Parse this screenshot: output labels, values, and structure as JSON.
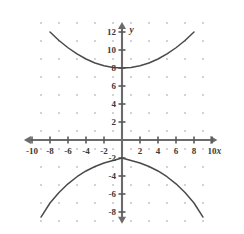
{
  "chart_data": {
    "type": "line",
    "title": "",
    "xlabel": "x",
    "ylabel": "y",
    "xlim": [
      -10.8,
      10.8
    ],
    "ylim": [
      -9.2,
      13.2
    ],
    "grid": "dots",
    "grid_spacing": 2,
    "legend": "none",
    "x_ticks": [
      -10,
      -8,
      -6,
      -4,
      -2,
      2,
      4,
      6,
      8,
      10
    ],
    "y_ticks": [
      2,
      4,
      6,
      8,
      10,
      12,
      -2,
      -4,
      -6,
      -8
    ],
    "x_tick_labels": [
      "-10",
      "-8",
      "-6",
      "-4",
      "-2",
      "2",
      "4",
      "6",
      "8",
      "10"
    ],
    "y_tick_labels": [
      "2",
      "4",
      "6",
      "8",
      "10",
      "12",
      "-2",
      "-4",
      "-6",
      "-8"
    ],
    "series": [
      {
        "name": "upper-branch",
        "vertex_x": 0,
        "vertex_y": 8,
        "x": [
          -8,
          -7,
          -6,
          -5,
          -4,
          -3,
          -2,
          -1,
          0,
          1,
          2,
          3,
          4,
          5,
          6,
          7,
          8
        ],
        "values": [
          12,
          11.06,
          10.25,
          9.56,
          9,
          8.56,
          8.25,
          8.06,
          8,
          8.06,
          8.25,
          8.56,
          9,
          9.56,
          10.25,
          11.06,
          12
        ]
      },
      {
        "name": "lower-branch",
        "vertex_x": 0,
        "vertex_y": -2,
        "x": [
          -9,
          -8,
          -7,
          -6,
          -5,
          -4,
          -3,
          -2,
          -1,
          0,
          1,
          2,
          3,
          4,
          5,
          6,
          7,
          8,
          9
        ],
        "values": [
          -8.56,
          -7,
          -5.83,
          -4.87,
          -4.08,
          -3.44,
          -2.94,
          -2.56,
          -2.28,
          -2,
          -2.28,
          -2.56,
          -2.94,
          -3.44,
          -4.08,
          -4.87,
          -5.83,
          -7,
          -8.56
        ]
      }
    ]
  },
  "axes": {
    "x_axis_label": "x",
    "y_axis_label": "y"
  },
  "colors": {
    "axis": "#6b6b6b",
    "curve": "#4a4a4a",
    "grid_dot": "#b9b9c4",
    "label": "#3a3a3a",
    "background": "#ffffff"
  }
}
